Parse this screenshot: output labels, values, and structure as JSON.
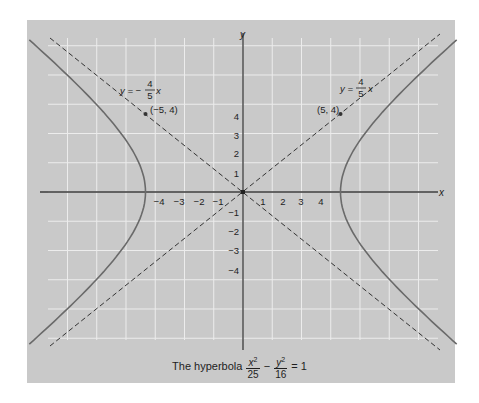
{
  "figure": {
    "caption": {
      "prefix": "The hyperbola",
      "term1_num": "x",
      "term1_den": "25",
      "operator": "−",
      "term2_num": "y",
      "term2_den": "16",
      "equals": "= 1",
      "exponent": "2"
    },
    "axes": {
      "x_label": "x",
      "y_label": "y",
      "x_ticks_negative": [
        "−4",
        "−3",
        "−2",
        "−1"
      ],
      "x_ticks_positive": [
        "1",
        "2",
        "3",
        "4"
      ],
      "y_ticks_positive": [
        "1",
        "2",
        "3",
        "4"
      ],
      "y_ticks_negative": [
        "−1",
        "−2",
        "−3",
        "−4"
      ]
    },
    "asymptotes": [
      {
        "label_lhs": "y = −",
        "num": "4",
        "den": "5",
        "var": "x",
        "point": "(−5, 4)"
      },
      {
        "label_lhs": "y =",
        "num": "4",
        "den": "5",
        "var": "x",
        "point": "(5, 4)"
      }
    ],
    "colors": {
      "panel": "#c9c9c9",
      "grid": "#ececec",
      "axis": "#3a3a3a",
      "curve": "#6a6a6a",
      "asymptote": "#333333"
    }
  },
  "chart_data": {
    "type": "line",
    "xlabel": "x",
    "ylabel": "y",
    "xlim": [
      -10,
      10
    ],
    "ylim": [
      -7.5,
      7.5
    ],
    "grid": true,
    "x_ticks": [
      -4,
      -3,
      -2,
      -1,
      1,
      2,
      3,
      4
    ],
    "y_ticks": [
      -4,
      -3,
      -2,
      -1,
      1,
      2,
      3,
      4
    ],
    "series": [
      {
        "name": "hyperbola right branch",
        "equation": "x^2/25 - y^2/16 = 1, x>0",
        "vertex": [
          5,
          0
        ]
      },
      {
        "name": "hyperbola left branch",
        "equation": "x^2/25 - y^2/16 = 1, x<0",
        "vertex": [
          -5,
          0
        ]
      },
      {
        "name": "asymptote y = 4/5 x",
        "style": "dashed",
        "slope": 0.8
      },
      {
        "name": "asymptote y = -4/5 x",
        "style": "dashed",
        "slope": -0.8
      }
    ],
    "annotations": [
      {
        "text": "(5, 4)",
        "x": 5,
        "y": 4
      },
      {
        "text": "(-5, 4)",
        "x": -5,
        "y": 4
      },
      {
        "text": "y = 4/5 x"
      },
      {
        "text": "y = -4/5 x"
      }
    ]
  }
}
